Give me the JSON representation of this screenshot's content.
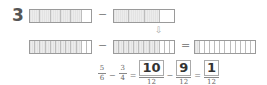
{
  "problem": {
    "number": "3"
  },
  "top_row": {
    "left_bar": {
      "cells": 6,
      "shaded": 5
    },
    "operator": "−",
    "right_bar": {
      "cells": 4,
      "shaded": 3
    }
  },
  "arrow": "⇩",
  "bottom_row": {
    "left_bar": {
      "cells": 12,
      "shaded": 10
    },
    "operator1": "−",
    "middle_bar": {
      "cells": 12,
      "shaded": 9
    },
    "operator2": "=",
    "result_bar": {
      "cells": 12,
      "shaded": 1
    }
  },
  "equation": {
    "f1": {
      "num": "5",
      "den": "6"
    },
    "op1": "−",
    "f2": {
      "num": "3",
      "den": "4"
    },
    "op2": "=",
    "f3": {
      "num": "10",
      "den": "12"
    },
    "op3": "−",
    "f4": {
      "num": "9",
      "den": "12"
    },
    "op4": "=",
    "f5": {
      "num": "1",
      "den": "12"
    }
  },
  "colors": {
    "shaded_cell": "#e6e6e6",
    "border": "#9a9a9a",
    "text": "#555555"
  }
}
